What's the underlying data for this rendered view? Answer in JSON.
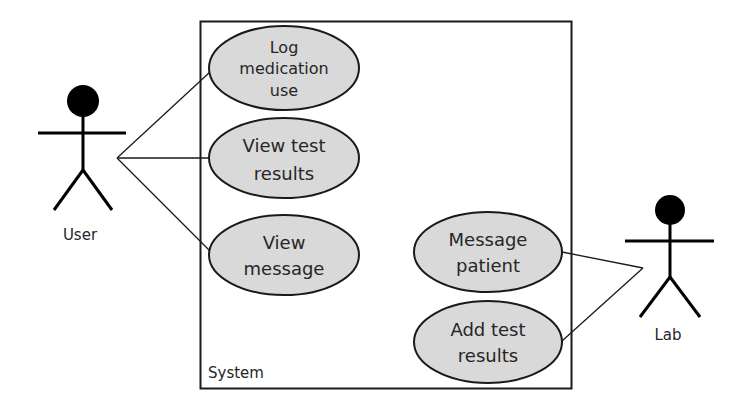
{
  "diagram": {
    "type": "UML use case diagram",
    "system": {
      "label": "System"
    },
    "actors": [
      {
        "id": "user",
        "label": "User"
      },
      {
        "id": "lab",
        "label": "Lab"
      }
    ],
    "use_cases": [
      {
        "id": "log_medication",
        "lines": [
          "Log",
          "medication",
          "use"
        ]
      },
      {
        "id": "view_test_results",
        "lines": [
          "View test",
          "results"
        ]
      },
      {
        "id": "view_message",
        "lines": [
          "View",
          "message"
        ]
      },
      {
        "id": "message_patient",
        "lines": [
          "Message",
          "patient"
        ]
      },
      {
        "id": "add_test_results",
        "lines": [
          "Add test",
          "results"
        ]
      }
    ],
    "associations": [
      {
        "from": "User",
        "to": "Log medication use"
      },
      {
        "from": "User",
        "to": "View test results"
      },
      {
        "from": "User",
        "to": "View message"
      },
      {
        "from": "Lab",
        "to": "Message patient"
      },
      {
        "from": "Lab",
        "to": "Add test results"
      }
    ],
    "colors": {
      "use_case_fill": "#d9d9d9",
      "stroke": "#1a1a1a",
      "actor_head": "#000000",
      "background": "#ffffff"
    }
  }
}
